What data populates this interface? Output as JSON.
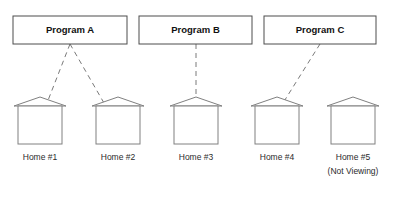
{
  "diagram": {
    "type": "program-home-viewing-diagram",
    "background_color": "#ffffff",
    "box_stroke_color": "#4d4d4d",
    "house_stroke_color": "#808080",
    "connector_color": "#7a7a7a",
    "text_color": "#1a1a1a",
    "programs": [
      {
        "id": "program-a",
        "label": "Program A",
        "x": 13,
        "y": 16,
        "width": 114,
        "height": 28,
        "anchor_x": 70,
        "anchor_y": 44
      },
      {
        "id": "program-b",
        "label": "Program B",
        "x": 139,
        "y": 16,
        "width": 113,
        "height": 28,
        "anchor_x": 196,
        "anchor_y": 44
      },
      {
        "id": "program-c",
        "label": "Program C",
        "x": 264,
        "y": 16,
        "width": 112,
        "height": 28,
        "anchor_x": 320,
        "anchor_y": 44
      }
    ],
    "homes": [
      {
        "id": "home-1",
        "label": "Home #1",
        "sublabel": "",
        "x": 18,
        "y": 106,
        "width": 44,
        "height": 38,
        "roof_apex_x": 40,
        "roof_apex_y": 97,
        "roof_eave_left_x": 14,
        "roof_eave_right_x": 66,
        "label_x": 40,
        "label_y": 158
      },
      {
        "id": "home-2",
        "label": "Home #2",
        "sublabel": "",
        "x": 96,
        "y": 106,
        "width": 44,
        "height": 38,
        "roof_apex_x": 118,
        "roof_apex_y": 97,
        "roof_eave_left_x": 92,
        "roof_eave_right_x": 144,
        "label_x": 118,
        "label_y": 158
      },
      {
        "id": "home-3",
        "label": "Home #3",
        "sublabel": "",
        "x": 174,
        "y": 106,
        "width": 44,
        "height": 38,
        "roof_apex_x": 196,
        "roof_apex_y": 97,
        "roof_eave_left_x": 170,
        "roof_eave_right_x": 222,
        "label_x": 196,
        "label_y": 158
      },
      {
        "id": "home-4",
        "label": "Home #4",
        "sublabel": "",
        "x": 255,
        "y": 106,
        "width": 44,
        "height": 38,
        "roof_apex_x": 277,
        "roof_apex_y": 97,
        "roof_eave_left_x": 251,
        "roof_eave_right_x": 303,
        "label_x": 277,
        "label_y": 158
      },
      {
        "id": "home-5",
        "label": "Home #5",
        "sublabel": "(Not Viewing)",
        "x": 331,
        "y": 106,
        "width": 44,
        "height": 38,
        "roof_apex_x": 353,
        "roof_apex_y": 97,
        "roof_eave_left_x": 327,
        "roof_eave_right_x": 379,
        "label_x": 353,
        "label_y": 158,
        "sublabel_x": 353,
        "sublabel_y": 172
      }
    ],
    "connections": [
      {
        "id": "conn-a-1",
        "from": "program-a",
        "to": "home-1",
        "x1": 70,
        "y1": 44,
        "x2": 47,
        "y2": 103,
        "style": "dashed"
      },
      {
        "id": "conn-a-2",
        "from": "program-a",
        "to": "home-2",
        "x1": 70,
        "y1": 44,
        "x2": 104,
        "y2": 103,
        "style": "dashed"
      },
      {
        "id": "conn-b-3",
        "from": "program-b",
        "to": "home-3",
        "x1": 196,
        "y1": 44,
        "x2": 196,
        "y2": 103,
        "style": "dashed"
      },
      {
        "id": "conn-c-4",
        "from": "program-c",
        "to": "home-4",
        "x1": 320,
        "y1": 44,
        "x2": 283,
        "y2": 103,
        "style": "dashed"
      }
    ]
  }
}
